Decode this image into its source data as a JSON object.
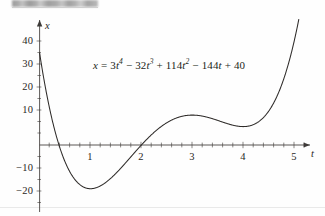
{
  "figure": {
    "redaction_note": "blurred-header-bar",
    "equation_text": "x = 3t4 − 32t3 + 114t2 − 144t + 40",
    "equation_parts": {
      "lhs": "x",
      "eq": "=",
      "term1_coef": "3",
      "term1_var": "t",
      "term1_exp": "4",
      "op1": "−",
      "term2_coef": "32",
      "term2_var": "t",
      "term2_exp": "3",
      "op2": "+",
      "term3_coef": "114",
      "term3_var": "t",
      "term3_exp": "2",
      "op3": "−",
      "term4_coef": "144",
      "term4_var": "t",
      "op4": "+",
      "constant": "40"
    }
  },
  "chart_data": {
    "type": "line",
    "title": "",
    "xlabel": "t",
    "ylabel": "x",
    "xlim": [
      -0.08,
      5.45
    ],
    "ylim": [
      -22,
      46
    ],
    "grid": false,
    "legend": null,
    "axis_arrows": [
      "x-positive",
      "y-positive"
    ],
    "xticks": [
      1,
      2,
      3,
      4,
      5
    ],
    "xtick_labels": [
      "1",
      "2",
      "3",
      "4",
      "5"
    ],
    "yticks": [
      -20,
      -10,
      10,
      20,
      30,
      40
    ],
    "ytick_labels": [
      "−20",
      "−10",
      "10",
      "20",
      "30",
      "40"
    ],
    "minor_tick_step_x": 0.2,
    "minor_tick_step_y": 5,
    "series": [
      {
        "name": "x = 3t^4 - 32t^3 + 114t^2 - 144t + 40",
        "color": "#2e2b29",
        "polynomial_coefficients": [
          3,
          -32,
          114,
          -144,
          40
        ],
        "x": [
          0.0,
          0.1,
          0.2,
          0.3,
          0.4,
          0.5,
          0.6,
          0.7,
          0.8,
          0.9,
          1.0,
          1.1,
          1.2,
          1.3,
          1.4,
          1.5,
          1.6,
          1.7,
          1.8,
          1.9,
          2.0,
          2.1,
          2.2,
          2.3,
          2.4,
          2.5,
          2.6,
          2.7,
          2.8,
          2.9,
          3.0,
          3.1,
          3.2,
          3.3,
          3.4,
          3.5,
          3.6,
          3.7,
          3.8,
          3.9,
          4.0,
          4.1,
          4.2,
          4.3,
          4.4,
          4.5,
          4.6,
          4.7,
          4.8,
          4.9,
          5.0,
          5.1,
          5.2,
          5.3
        ],
        "y": [
          40.0,
          26.72,
          15.79,
          7.01,
          0.17,
          -4.94,
          -8.5,
          -10.7,
          -11.74,
          -11.81,
          -11.0,
          -9.52,
          -7.49,
          -5.07,
          -2.4,
          0.38,
          3.14,
          5.78,
          8.19,
          10.3,
          12.0,
          13.25,
          13.99,
          14.2,
          13.86,
          12.94,
          11.5,
          9.57,
          7.26,
          4.67,
          2.0,
          0.57,
          0.09,
          0.64,
          2.33,
          5.19,
          9.24,
          14.44,
          20.69,
          27.85,
          36.0,
          44.62,
          54.67,
          66.18,
          79.35,
          94.56,
          111.92,
          131.86,
          154.47,
          180.43,
          210.0,
          243.54,
          281.41,
          324.02
        ],
        "note_rendered_range_x": [
          0.0,
          5.28
        ],
        "key_points": {
          "y_intercept": 40,
          "local_min_1": {
            "t": 0.87,
            "x": -11.85
          },
          "local_max": {
            "t": 2.27,
            "x": 14.22
          },
          "local_min_2": {
            "t": 3.21,
            "x": 0.05
          },
          "roots_visible": [
            0.4,
            1.48
          ]
        }
      }
    ]
  }
}
